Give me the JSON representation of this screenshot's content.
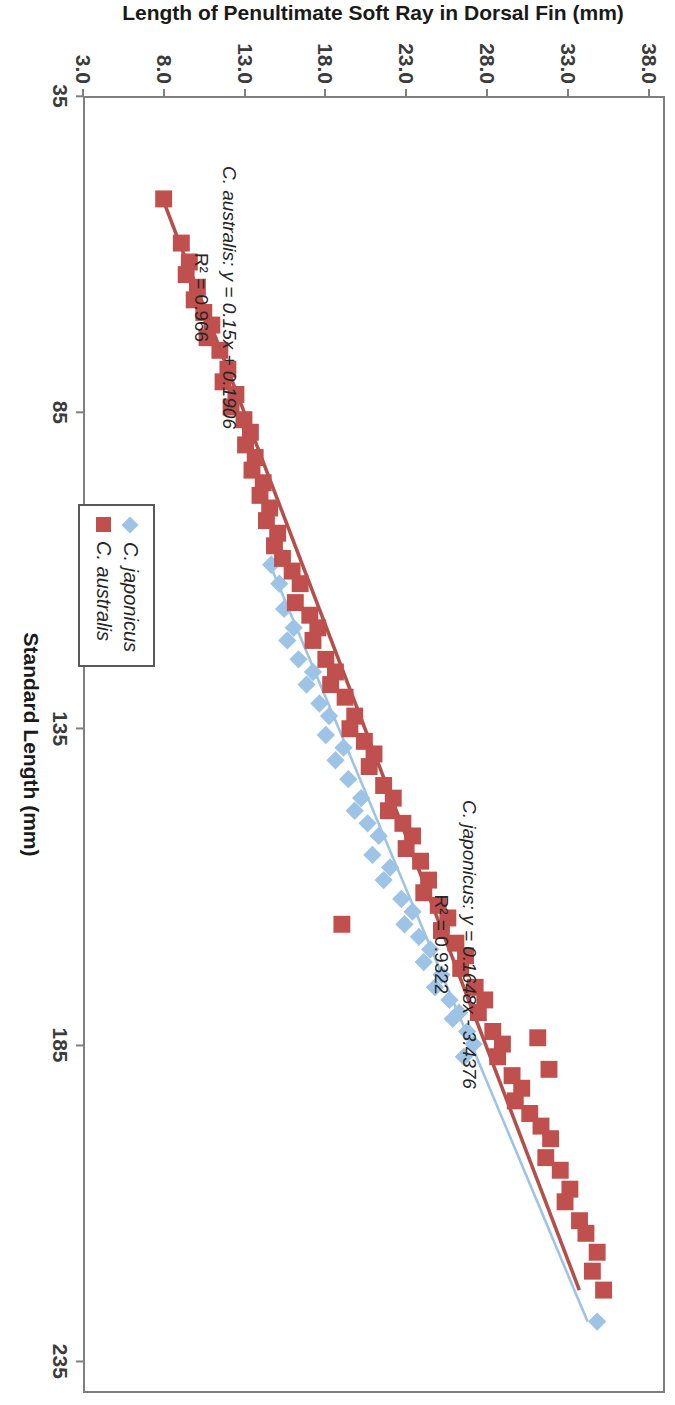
{
  "chart_data": {
    "type": "scatter",
    "title": "Callanthias",
    "xlabel": "Standard Length (mm)",
    "ylabel": "Length of Penultimate Soft Ray in Dorsal Fin (mm)",
    "xlim": [
      35,
      240
    ],
    "ylim": [
      3.0,
      39.0
    ],
    "xticks": [
      "35",
      "85",
      "135",
      "185",
      "235"
    ],
    "xtick_values": [
      35,
      85,
      135,
      185,
      235
    ],
    "yticks": [
      "3.0",
      "8.0",
      "13.0",
      "18.0",
      "23.0",
      "28.0",
      "33.0",
      "38.0"
    ],
    "ytick_values": [
      3.0,
      8.0,
      13.0,
      18.0,
      23.0,
      28.0,
      33.0,
      38.0
    ],
    "grid": false,
    "legend_position": "inside-lower-right",
    "series": [
      {
        "name": "C. japonicus",
        "marker": "diamond",
        "color": "#9DC3E6",
        "trendline_color": "#9DC3E6",
        "equation": "C. japonicus: y = 0.1648x - 3.4376",
        "r2": "R² = 0.9322",
        "slope": 0.1648,
        "intercept": -3.4376,
        "r2_value": 0.9322,
        "points": [
          [
            109,
            14.6
          ],
          [
            112,
            15.1
          ],
          [
            116,
            15.4
          ],
          [
            119,
            16.0
          ],
          [
            121,
            15.6
          ],
          [
            124,
            16.3
          ],
          [
            126,
            17.2
          ],
          [
            128,
            16.8
          ],
          [
            131,
            17.6
          ],
          [
            133,
            18.2
          ],
          [
            136,
            18.0
          ],
          [
            138,
            19.1
          ],
          [
            140,
            18.6
          ],
          [
            143,
            19.4
          ],
          [
            146,
            20.2
          ],
          [
            148,
            19.8
          ],
          [
            150,
            20.6
          ],
          [
            152,
            21.3
          ],
          [
            155,
            20.9
          ],
          [
            157,
            22.0
          ],
          [
            159,
            21.6
          ],
          [
            162,
            22.7
          ],
          [
            164,
            23.4
          ],
          [
            166,
            22.9
          ],
          [
            168,
            23.8
          ],
          [
            170,
            24.5
          ],
          [
            172,
            24.1
          ],
          [
            174,
            25.2
          ],
          [
            176,
            24.8
          ],
          [
            178,
            25.7
          ],
          [
            180,
            26.3
          ],
          [
            181,
            25.9
          ],
          [
            183,
            26.8
          ],
          [
            185,
            27.2
          ],
          [
            187,
            26.6
          ],
          [
            229,
            34.9
          ]
        ]
      },
      {
        "name": "C. australis",
        "marker": "square",
        "color": "#C0504D",
        "trendline_color": "#B4504C",
        "equation": "C. australis: y = 0.15x + 0.1906",
        "r2": "R² = 0.966",
        "slope": 0.15,
        "intercept": 0.1906,
        "r2_value": 0.966,
        "points": [
          [
            51,
            7.9
          ],
          [
            58,
            9.0
          ],
          [
            61,
            9.5
          ],
          [
            63,
            9.3
          ],
          [
            65,
            10.0
          ],
          [
            67,
            9.8
          ],
          [
            69,
            10.4
          ],
          [
            71,
            10.9
          ],
          [
            73,
            10.6
          ],
          [
            75,
            11.4
          ],
          [
            78,
            11.9
          ],
          [
            80,
            11.6
          ],
          [
            82,
            12.4
          ],
          [
            84,
            12.1
          ],
          [
            86,
            12.9
          ],
          [
            88,
            13.3
          ],
          [
            90,
            13.0
          ],
          [
            92,
            13.6
          ],
          [
            94,
            13.4
          ],
          [
            96,
            14.1
          ],
          [
            98,
            13.9
          ],
          [
            100,
            14.5
          ],
          [
            102,
            14.3
          ],
          [
            104,
            15.0
          ],
          [
            106,
            14.8
          ],
          [
            108,
            15.3
          ],
          [
            110,
            15.9
          ],
          [
            112,
            16.4
          ],
          [
            115,
            16.1
          ],
          [
            117,
            17.0
          ],
          [
            119,
            17.5
          ],
          [
            121,
            17.2
          ],
          [
            124,
            18.0
          ],
          [
            126,
            18.6
          ],
          [
            128,
            18.3
          ],
          [
            130,
            19.2
          ],
          [
            133,
            19.8
          ],
          [
            135,
            19.5
          ],
          [
            137,
            20.4
          ],
          [
            139,
            21.0
          ],
          [
            141,
            20.7
          ],
          [
            144,
            21.6
          ],
          [
            146,
            22.2
          ],
          [
            148,
            21.9
          ],
          [
            150,
            22.8
          ],
          [
            152,
            23.4
          ],
          [
            154,
            23.0
          ],
          [
            156,
            23.9
          ],
          [
            159,
            24.4
          ],
          [
            161,
            24.1
          ],
          [
            163,
            25.0
          ],
          [
            165,
            25.6
          ],
          [
            167,
            25.2
          ],
          [
            169,
            26.1
          ],
          [
            171,
            26.7
          ],
          [
            166,
            19.0
          ],
          [
            173,
            26.4
          ],
          [
            176,
            27.3
          ],
          [
            178,
            27.9
          ],
          [
            180,
            27.5
          ],
          [
            183,
            28.4
          ],
          [
            185,
            29.0
          ],
          [
            187,
            28.7
          ],
          [
            190,
            29.6
          ],
          [
            192,
            30.2
          ],
          [
            194,
            29.8
          ],
          [
            196,
            30.7
          ],
          [
            184,
            31.2
          ],
          [
            189,
            31.9
          ],
          [
            198,
            31.4
          ],
          [
            200,
            32.0
          ],
          [
            203,
            31.7
          ],
          [
            205,
            32.6
          ],
          [
            208,
            33.2
          ],
          [
            210,
            32.9
          ],
          [
            213,
            33.8
          ],
          [
            215,
            34.2
          ],
          [
            218,
            34.9
          ],
          [
            221,
            34.6
          ],
          [
            224,
            35.3
          ]
        ]
      }
    ]
  },
  "legend": {
    "items": [
      {
        "label": "C. japonicus",
        "marker": "diamond",
        "color": "#9DC3E6"
      },
      {
        "label": "C. australis",
        "marker": "square",
        "color": "#C0504D"
      }
    ]
  },
  "annotations": {
    "australis_equation": "C. australis: y = 0.15x + 0.1906",
    "australis_r2": "R² = 0.966",
    "japonicus_equation": "C. japonicus: y = 0.1648x - 3.4376",
    "japonicus_r2": "R² = 0.9322"
  },
  "colors": {
    "japonicus": "#9DC3E6",
    "australis": "#C0504D",
    "axis": "#7f7f7f",
    "text": "#262626",
    "background": "#ffffff"
  }
}
